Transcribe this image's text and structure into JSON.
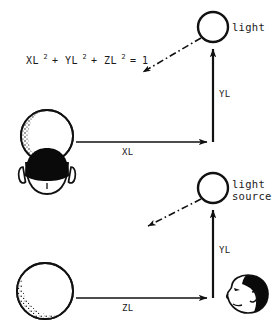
{
  "figure": {
    "background_color": "#ffffff",
    "ink_color": "#111111",
    "equation": {
      "terms": [
        {
          "base": "XL",
          "exp": "2"
        },
        {
          "op": "+"
        },
        {
          "base": "YL",
          "exp": "2"
        },
        {
          "op": "+"
        },
        {
          "base": "ZL",
          "exp": "2"
        },
        {
          "op": "="
        },
        {
          "base": "1",
          "exp": ""
        }
      ],
      "plain": "XL2 + YL2 + ZL2 = 1",
      "t_xl": "XL",
      "t_yl": "YL",
      "t_zl": "ZL",
      "sup": "2",
      "plus1": "+",
      "plus2": "+",
      "equals": "=",
      "one": "1"
    },
    "upper_panel": {
      "light_label": "light",
      "horizontal_axis_label": "XL",
      "vertical_axis_label": "YL",
      "sphere_name": "shaded-sphere",
      "observer_name": "head-rear-view"
    },
    "lower_panel": {
      "light_label_line1": "light",
      "light_label_line2": "source",
      "horizontal_axis_label": "ZL",
      "vertical_axis_label": "YL",
      "sphere_name": "shaded-sphere",
      "observer_name": "head-profile-view"
    }
  }
}
